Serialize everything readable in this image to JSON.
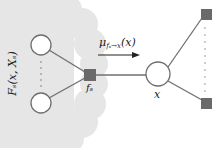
{
  "diagram": {
    "type": "factor-graph",
    "title": "",
    "colors": {
      "cloud": "#e6e6e6",
      "factor": "#6a6a6a",
      "edge": "#6f6f6f",
      "variable_fill": "#ffffff",
      "variable_stroke": "#6f6f6f",
      "arrow": "#222222"
    },
    "labels": {
      "subtree": "F_s(x, X_s)",
      "subtree_display": "Fₛ(x, Xₛ)",
      "factor": "f_s",
      "factor_display": "fₛ",
      "message": "μ_{f_s→x}(x)",
      "message_display": "μ",
      "message_sub": "fₛ→x",
      "message_arg": "(x)",
      "variable": "x"
    },
    "nodes": [
      {
        "id": "left-var-top",
        "kind": "variable",
        "cx": 41,
        "cy": 45,
        "r": 10
      },
      {
        "id": "left-var-bottom",
        "kind": "variable",
        "cx": 41,
        "cy": 103,
        "r": 10
      },
      {
        "id": "factor-fs",
        "kind": "factor",
        "x": 84,
        "y": 69,
        "size": 12
      },
      {
        "id": "variable-x",
        "kind": "variable",
        "cx": 158,
        "cy": 74,
        "r": 12
      },
      {
        "id": "right-factor-top",
        "kind": "factor",
        "x": 201,
        "y": 9,
        "size": 11
      },
      {
        "id": "right-factor-bottom",
        "kind": "factor",
        "x": 201,
        "y": 98,
        "size": 11
      }
    ],
    "edges": [
      {
        "from": "left-var-top",
        "to": "factor-fs"
      },
      {
        "from": "left-var-bottom",
        "to": "factor-fs"
      },
      {
        "from": "factor-fs",
        "to": "variable-x"
      },
      {
        "from": "variable-x",
        "to": "right-factor-top"
      },
      {
        "from": "variable-x",
        "to": "right-factor-bottom"
      }
    ],
    "ellipses": [
      {
        "id": "left-dots",
        "x": 41,
        "from": 60,
        "to": 88
      },
      {
        "id": "right-dots",
        "x": 205,
        "from": 26,
        "to": 94
      }
    ]
  }
}
